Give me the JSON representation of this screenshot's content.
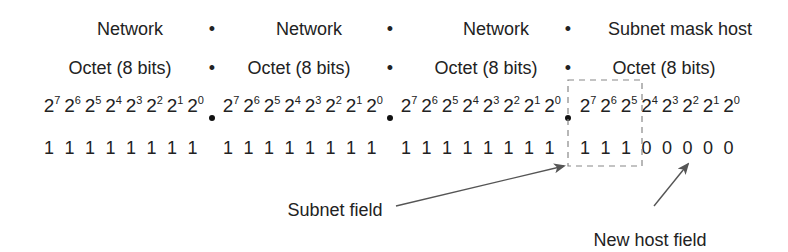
{
  "diagram": {
    "row_labels": [
      {
        "text": "Network",
        "x": 130
      },
      {
        "text": "Network",
        "x": 309
      },
      {
        "text": "Network",
        "x": 496
      },
      {
        "text": "Subnet mask host",
        "x": 680
      }
    ],
    "octet_labels": [
      {
        "text": "Octet (8 bits)",
        "x": 120
      },
      {
        "text": "Octet (8 bits)",
        "x": 299
      },
      {
        "text": "Octet (8 bits)",
        "x": 486
      },
      {
        "text": "Octet (8 bits)",
        "x": 664
      }
    ],
    "separator_glyph": "•",
    "separator_x": [
      212,
      390,
      568
    ],
    "power_base": "2",
    "octets": [
      {
        "start_x": 52,
        "powers": [
          "7",
          "6",
          "5",
          "4",
          "3",
          "2",
          "1",
          "0"
        ],
        "bits": [
          "1",
          "1",
          "1",
          "1",
          "1",
          "1",
          "1",
          "1"
        ]
      },
      {
        "start_x": 231,
        "powers": [
          "7",
          "6",
          "5",
          "4",
          "3",
          "2",
          "1",
          "0"
        ],
        "bits": [
          "1",
          "1",
          "1",
          "1",
          "1",
          "1",
          "1",
          "1"
        ]
      },
      {
        "start_x": 409,
        "powers": [
          "7",
          "6",
          "5",
          "4",
          "3",
          "2",
          "1",
          "0"
        ],
        "bits": [
          "1",
          "1",
          "1",
          "1",
          "1",
          "1",
          "1",
          "1"
        ]
      },
      {
        "start_x": 588,
        "powers": [
          "7",
          "6",
          "5",
          "4",
          "3",
          "2",
          "1",
          "0"
        ],
        "bits": [
          "1",
          "1",
          "1",
          "0",
          "0",
          "0",
          "0",
          "0"
        ]
      }
    ],
    "bit_step": 20.5,
    "subnet_field_label": "Subnet field",
    "new_host_field_label": "New host field",
    "colors": {
      "text": "#222222",
      "dash": "#888888",
      "arrow": "#555555"
    }
  }
}
